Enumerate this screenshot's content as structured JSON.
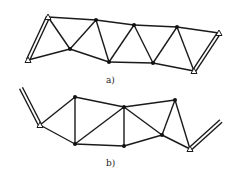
{
  "figure": {
    "panels": [
      {
        "id": "a",
        "label": "a)",
        "label_pos": [
          106,
          83
        ],
        "nodes": [
          {
            "id": "A1",
            "x": 48,
            "y": 17,
            "type": "support"
          },
          {
            "id": "A2",
            "x": 28,
            "y": 60,
            "type": "support"
          },
          {
            "id": "N1",
            "x": 70,
            "y": 49,
            "type": "joint"
          },
          {
            "id": "N2",
            "x": 96,
            "y": 20,
            "type": "joint"
          },
          {
            "id": "N3",
            "x": 109,
            "y": 62,
            "type": "joint"
          },
          {
            "id": "N4",
            "x": 134,
            "y": 25,
            "type": "joint"
          },
          {
            "id": "N5",
            "x": 153,
            "y": 63,
            "type": "joint"
          },
          {
            "id": "N6",
            "x": 177,
            "y": 27,
            "type": "joint"
          },
          {
            "id": "B1",
            "x": 219,
            "y": 33,
            "type": "support"
          },
          {
            "id": "B2",
            "x": 194,
            "y": 71,
            "type": "support"
          }
        ],
        "members": [
          [
            "A1",
            "N2"
          ],
          [
            "N2",
            "N4"
          ],
          [
            "N4",
            "N6"
          ],
          [
            "N6",
            "B1"
          ],
          [
            "A2",
            "N1"
          ],
          [
            "N1",
            "N3"
          ],
          [
            "N3",
            "N5"
          ],
          [
            "N5",
            "B2"
          ],
          [
            "A1",
            "N1"
          ],
          [
            "N1",
            "N2"
          ],
          [
            "N2",
            "N3"
          ],
          [
            "N3",
            "N4"
          ],
          [
            "N4",
            "N5"
          ],
          [
            "N5",
            "N6"
          ],
          [
            "N6",
            "B2"
          ]
        ],
        "double_members": [
          [
            "A1",
            "A2"
          ],
          [
            "B1",
            "B2"
          ]
        ]
      },
      {
        "id": "b",
        "label": "b)",
        "label_pos": [
          106,
          166
        ],
        "nodes": [
          {
            "id": "S1",
            "x": 40,
            "y": 125,
            "type": "support"
          },
          {
            "id": "M1",
            "x": 75,
            "y": 97,
            "type": "joint"
          },
          {
            "id": "M2",
            "x": 75,
            "y": 144,
            "type": "joint"
          },
          {
            "id": "M3",
            "x": 124,
            "y": 107,
            "type": "joint"
          },
          {
            "id": "M4",
            "x": 124,
            "y": 146,
            "type": "joint"
          },
          {
            "id": "M5",
            "x": 162,
            "y": 135,
            "type": "joint"
          },
          {
            "id": "M6",
            "x": 175,
            "y": 100,
            "type": "joint"
          },
          {
            "id": "S2",
            "x": 190,
            "y": 149,
            "type": "support"
          }
        ],
        "members": [
          [
            "S1",
            "M1"
          ],
          [
            "S1",
            "M2"
          ],
          [
            "M1",
            "M2"
          ],
          [
            "M1",
            "M3"
          ],
          [
            "M2",
            "M3"
          ],
          [
            "M2",
            "M4"
          ],
          [
            "M3",
            "M4"
          ],
          [
            "M3",
            "M5"
          ],
          [
            "M4",
            "M5"
          ],
          [
            "M3",
            "M6"
          ],
          [
            "M5",
            "M6"
          ],
          [
            "M5",
            "S2"
          ],
          [
            "M6",
            "S2"
          ]
        ],
        "rails": [
          {
            "from": [
              21,
              88
            ],
            "to": [
              40,
              125
            ]
          },
          {
            "from": [
              221,
              121
            ],
            "to": [
              190,
              149
            ]
          }
        ]
      }
    ]
  }
}
